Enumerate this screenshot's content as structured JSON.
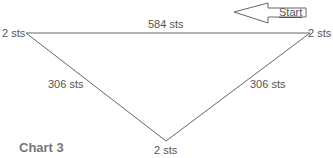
{
  "diagram": {
    "title": "Chart 3",
    "start_label": "Start",
    "vertices": {
      "top_left": "2 sts",
      "top_right": "2 sts",
      "bottom": "2 sts"
    },
    "edges": {
      "top": "584 sts",
      "left": "306 sts",
      "right": "306 sts"
    },
    "colors": {
      "line": "#666666",
      "text": "#555555",
      "title": "#777777"
    }
  }
}
